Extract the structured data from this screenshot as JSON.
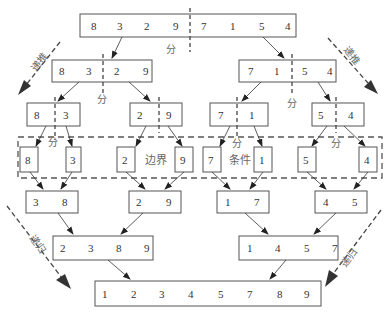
{
  "labels": {
    "divide": "分",
    "boundary": "边界",
    "condition": "条件",
    "recurse_down": "递推",
    "recurse_up": "递归"
  },
  "levels": [
    {
      "name": "input",
      "boxes": [
        {
          "values": [
            "8",
            "3",
            "2",
            "9",
            "7",
            "1",
            "5",
            "4"
          ],
          "split_after": 4
        }
      ]
    },
    {
      "name": "split-1",
      "boxes": [
        {
          "values": [
            "8",
            "3",
            "2",
            "9"
          ],
          "split_after": 2
        },
        {
          "values": [
            "7",
            "1",
            "5",
            "4"
          ],
          "split_after": 2
        }
      ]
    },
    {
      "name": "split-2",
      "boxes": [
        {
          "values": [
            "8",
            "3"
          ],
          "split_after": 1
        },
        {
          "values": [
            "2",
            "9"
          ],
          "split_after": 1
        },
        {
          "values": [
            "7",
            "1"
          ],
          "split_after": 1
        },
        {
          "values": [
            "5",
            "4"
          ],
          "split_after": 1
        }
      ]
    },
    {
      "name": "base-case",
      "boxes": [
        {
          "values": [
            "8"
          ]
        },
        {
          "values": [
            "3"
          ]
        },
        {
          "values": [
            "2"
          ]
        },
        {
          "values": [
            "9"
          ]
        },
        {
          "values": [
            "7"
          ]
        },
        {
          "values": [
            "1"
          ]
        },
        {
          "values": [
            "5"
          ]
        },
        {
          "values": [
            "4"
          ]
        }
      ]
    },
    {
      "name": "merge-1",
      "boxes": [
        {
          "values": [
            "3",
            "8"
          ]
        },
        {
          "values": [
            "2",
            "9"
          ]
        },
        {
          "values": [
            "1",
            "7"
          ]
        },
        {
          "values": [
            "4",
            "5"
          ]
        }
      ]
    },
    {
      "name": "merge-2",
      "boxes": [
        {
          "values": [
            "2",
            "3",
            "8",
            "9"
          ]
        },
        {
          "values": [
            "1",
            "4",
            "5",
            "7"
          ]
        }
      ]
    },
    {
      "name": "output",
      "boxes": [
        {
          "values": [
            "1",
            "2",
            "3",
            "4",
            "5",
            "7",
            "8",
            "9"
          ]
        }
      ]
    }
  ],
  "colors": {
    "line": "#555555",
    "text": "#333333",
    "label": "#666666",
    "dash": "#555555"
  }
}
